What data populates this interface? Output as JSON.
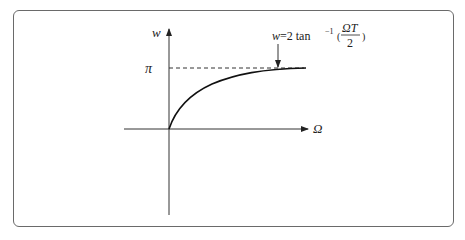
{
  "diagram": {
    "title": "",
    "y_axis_label": "w",
    "x_axis_label": "Ω",
    "asymptote_label": "π",
    "annotation": {
      "lhs": "w=2 tan",
      "exponent": "−1",
      "open_paren": "(",
      "numerator": "ΩT",
      "denominator": "2",
      "close_paren": ")"
    },
    "curve": "w = 2 tan^-1(ΩT/2), rising from origin and approaching π asymptotically",
    "colors": {
      "stroke": "#222222",
      "frame": "#6a6a6a",
      "background": "#ffffff"
    }
  }
}
